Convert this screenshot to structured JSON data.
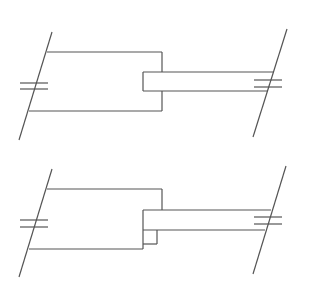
{
  "diagram": {
    "type": "mechanical-schematic",
    "stroke_color": "#555555",
    "background": "#ffffff",
    "panels": [
      {
        "id": "upper",
        "label": "",
        "components": [
          "left-wall",
          "housing-block",
          "rod",
          "right-wall"
        ]
      },
      {
        "id": "lower",
        "label": "",
        "components": [
          "left-wall",
          "housing-block",
          "rod",
          "spacer-block",
          "right-wall"
        ]
      }
    ]
  }
}
